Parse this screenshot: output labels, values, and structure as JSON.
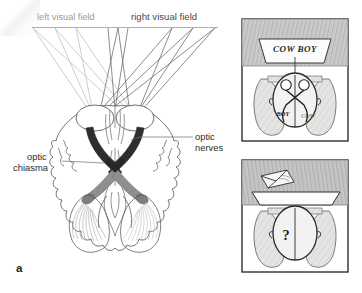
{
  "figure": {
    "panels": [
      {
        "letter": "a",
        "caption": "a"
      },
      {
        "letter": "b",
        "caption": "b"
      }
    ]
  },
  "panel_a": {
    "letter": "a",
    "labels": {
      "left_visual_field": "left visual field",
      "right_visual_field": "right visual field",
      "optic_nerves_line1": "optic",
      "optic_nerves_line2": "nerves",
      "optic_chiasma_line1": "optic",
      "optic_chiasma_line2": "chiasma"
    },
    "colors": {
      "left_field_rays": "#b5b5b5",
      "right_field_rays": "#6d6d6d",
      "optic_nerve_dark": "#2e2e2e",
      "optic_tract_gray": "#8d8d8d",
      "brain_outline": "#555555",
      "field_line": "#8c8c8c"
    },
    "structures": [
      "left visual field",
      "right visual field",
      "eyes",
      "optic nerves",
      "optic chiasma",
      "optic tracts",
      "optic radiations",
      "occipital cortex",
      "cerebral hemispheres"
    ]
  },
  "panel_b": {
    "letter": "b",
    "top_sketch": {
      "screen_text": "COW BOY",
      "brain_left_text": "COW",
      "brain_right_text": "BOY",
      "description": "subject facing screen displaying COW BOY, each hemisphere receives half the word"
    },
    "bottom_sketch": {
      "head_symbol": "?",
      "paper_label": "torn-paper",
      "description": "screen blank, subject cannot report the word"
    },
    "colors": {
      "pencil_shade": "#9a9a9a",
      "pencil_dark": "#4a4a4a",
      "screen_fill": "#fdfdfd"
    }
  }
}
